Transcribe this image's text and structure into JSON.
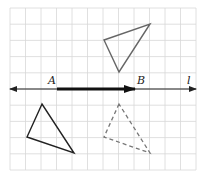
{
  "diagram": {
    "type": "translation-on-grid",
    "grid": {
      "x0": 10,
      "y0": 8,
      "cols": 12,
      "rows": 10,
      "cell_w": 15.5,
      "cell_h": 16.2,
      "color": "#d8d8d8"
    },
    "line_l": {
      "label": "l",
      "y": 89,
      "x1": 10,
      "x2": 196,
      "color": "#222222"
    },
    "vector_AB": {
      "start_label": "A",
      "end_label": "B",
      "x1": 57,
      "x2": 135,
      "y": 89,
      "color": "#111111"
    },
    "labels": [
      {
        "text": "A",
        "x": 48,
        "y": 84
      },
      {
        "text": "B",
        "x": 137,
        "y": 84
      },
      {
        "text": "l",
        "x": 187,
        "y": 84
      }
    ],
    "triangles": [
      {
        "name": "upper-triangle",
        "points": [
          [
            104,
            40
          ],
          [
            150,
            24
          ],
          [
            119,
            72
          ]
        ],
        "style": "solid",
        "color": "#666666"
      },
      {
        "name": "lower-solid-triangle",
        "points": [
          [
            42,
            104
          ],
          [
            27,
            137
          ],
          [
            74,
            153
          ]
        ],
        "style": "solid",
        "color": "#222222"
      },
      {
        "name": "lower-dashed-triangle",
        "points": [
          [
            119,
            104
          ],
          [
            104,
            137
          ],
          [
            150,
            153
          ]
        ],
        "style": "dashed",
        "color": "#777777"
      }
    ]
  }
}
